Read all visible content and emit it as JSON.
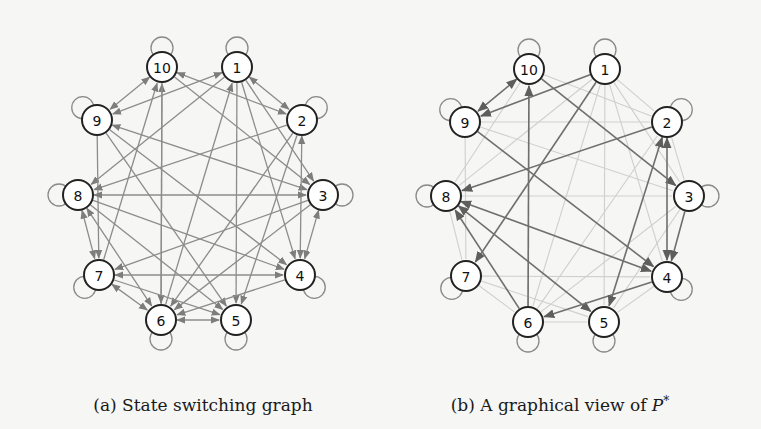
{
  "figure": {
    "panels": [
      {
        "id": "a",
        "caption": "(a) State switching graph",
        "caption_pos": [
          203,
          411
        ],
        "edge_color": "#8c8c8c",
        "nodes": [
          {
            "id": "1",
            "x": 237,
            "y": 67,
            "loop": "up"
          },
          {
            "id": "2",
            "x": 302,
            "y": 120,
            "loop": "upright"
          },
          {
            "id": "3",
            "x": 323,
            "y": 195,
            "loop": "right"
          },
          {
            "id": "4",
            "x": 300,
            "y": 275,
            "loop": "downright"
          },
          {
            "id": "5",
            "x": 236,
            "y": 320,
            "loop": "down"
          },
          {
            "id": "6",
            "x": 161,
            "y": 320,
            "loop": "down"
          },
          {
            "id": "7",
            "x": 99,
            "y": 275,
            "loop": "downleft"
          },
          {
            "id": "8",
            "x": 78,
            "y": 195,
            "loop": "left"
          },
          {
            "id": "9",
            "x": 97,
            "y": 120,
            "loop": "upleft"
          },
          {
            "id": "10",
            "x": 162,
            "y": 67,
            "loop": "up"
          }
        ],
        "edges": [
          {
            "from": "10",
            "to": "9",
            "both": true,
            "w": "dark"
          },
          {
            "from": "1",
            "to": "9",
            "both": true,
            "w": "dark"
          },
          {
            "from": "1",
            "to": "2",
            "both": true,
            "w": "dark"
          },
          {
            "from": "10",
            "to": "2",
            "both": true,
            "w": "dark"
          },
          {
            "from": "10",
            "to": "3",
            "both": false,
            "w": "dark"
          },
          {
            "from": "1",
            "to": "8",
            "both": false,
            "w": "dark"
          },
          {
            "from": "1",
            "to": "4",
            "both": false,
            "w": "dark"
          },
          {
            "from": "1",
            "to": "5",
            "both": false,
            "w": "dark"
          },
          {
            "from": "1",
            "to": "3",
            "both": false,
            "w": "dark"
          },
          {
            "from": "6",
            "to": "1",
            "both": false,
            "w": "dark"
          },
          {
            "from": "6",
            "to": "10",
            "both": false,
            "w": "dark"
          },
          {
            "from": "7",
            "to": "10",
            "both": false,
            "w": "dark"
          },
          {
            "from": "10",
            "to": "6",
            "both": false,
            "w": "dark"
          },
          {
            "from": "9",
            "to": "3",
            "both": true,
            "w": "dark"
          },
          {
            "from": "9",
            "to": "5",
            "both": false,
            "w": "dark"
          },
          {
            "from": "9",
            "to": "7",
            "both": false,
            "w": "dark"
          },
          {
            "from": "2",
            "to": "8",
            "both": false,
            "w": "dark"
          },
          {
            "from": "2",
            "to": "4",
            "both": true,
            "w": "dark"
          },
          {
            "from": "2",
            "to": "6",
            "both": false,
            "w": "dark"
          },
          {
            "from": "2",
            "to": "5",
            "both": false,
            "w": "dark"
          },
          {
            "from": "8",
            "to": "3",
            "both": true,
            "w": "dark"
          },
          {
            "from": "8",
            "to": "4",
            "both": false,
            "w": "dark"
          },
          {
            "from": "8",
            "to": "5",
            "both": false,
            "w": "dark"
          },
          {
            "from": "8",
            "to": "7",
            "both": true,
            "w": "dark"
          },
          {
            "from": "8",
            "to": "6",
            "both": true,
            "w": "dark"
          },
          {
            "from": "3",
            "to": "4",
            "both": true,
            "w": "dark"
          },
          {
            "from": "3",
            "to": "6",
            "both": false,
            "w": "dark"
          },
          {
            "from": "3",
            "to": "7",
            "both": false,
            "w": "dark"
          },
          {
            "from": "7",
            "to": "4",
            "both": true,
            "w": "dark"
          },
          {
            "from": "7",
            "to": "6",
            "both": true,
            "w": "dark"
          },
          {
            "from": "7",
            "to": "5",
            "both": false,
            "w": "dark"
          },
          {
            "from": "4",
            "to": "6",
            "both": false,
            "w": "dark"
          },
          {
            "from": "6",
            "to": "5",
            "both": true,
            "w": "dark"
          },
          {
            "from": "9",
            "to": "4",
            "both": false,
            "w": "dark"
          }
        ]
      },
      {
        "id": "b",
        "caption": "(b) A graphical view of P*",
        "caption_pos": [
          560,
          411
        ],
        "edge_color": "#6f6f6f",
        "light_edge_color": "#cfcfcf",
        "nodes": [
          {
            "id": "1",
            "x": 605,
            "y": 69,
            "loop": "up"
          },
          {
            "id": "2",
            "x": 667,
            "y": 122,
            "loop": "upright"
          },
          {
            "id": "3",
            "x": 689,
            "y": 196,
            "loop": "right"
          },
          {
            "id": "4",
            "x": 667,
            "y": 277,
            "loop": "downright"
          },
          {
            "id": "5",
            "x": 604,
            "y": 322,
            "loop": "down"
          },
          {
            "id": "6",
            "x": 528,
            "y": 322,
            "loop": "down"
          },
          {
            "id": "7",
            "x": 466,
            "y": 276,
            "loop": "downleft"
          },
          {
            "id": "8",
            "x": 446,
            "y": 196,
            "loop": "left"
          },
          {
            "id": "9",
            "x": 465,
            "y": 122,
            "loop": "upleft"
          },
          {
            "id": "10",
            "x": 529,
            "y": 69,
            "loop": "up"
          }
        ],
        "edges": [
          {
            "from": "10",
            "to": "9",
            "both": true,
            "w": "dark"
          },
          {
            "from": "1",
            "to": "9",
            "both": false,
            "w": "dark"
          },
          {
            "from": "10",
            "to": "3",
            "both": false,
            "w": "dark"
          },
          {
            "from": "9",
            "to": "4",
            "both": false,
            "w": "dark"
          },
          {
            "from": "2",
            "to": "8",
            "both": false,
            "w": "dark"
          },
          {
            "from": "6",
            "to": "10",
            "both": false,
            "w": "dark"
          },
          {
            "from": "8",
            "to": "4",
            "both": true,
            "w": "dark"
          },
          {
            "from": "8",
            "to": "5",
            "both": true,
            "w": "dark"
          },
          {
            "from": "6",
            "to": "8",
            "both": false,
            "w": "dark"
          },
          {
            "from": "4",
            "to": "6",
            "both": false,
            "w": "dark"
          },
          {
            "from": "2",
            "to": "4",
            "both": true,
            "w": "dark"
          },
          {
            "from": "3",
            "to": "4",
            "both": false,
            "w": "dark"
          },
          {
            "from": "2",
            "to": "5",
            "both": true,
            "w": "dark"
          },
          {
            "from": "1",
            "to": "7",
            "both": false,
            "w": "dark"
          },
          {
            "from": "1",
            "to": "2",
            "both": false,
            "w": "light"
          },
          {
            "from": "1",
            "to": "3",
            "both": false,
            "w": "light"
          },
          {
            "from": "1",
            "to": "4",
            "both": false,
            "w": "light"
          },
          {
            "from": "1",
            "to": "5",
            "both": false,
            "w": "light"
          },
          {
            "from": "1",
            "to": "6",
            "both": false,
            "w": "light"
          },
          {
            "from": "1",
            "to": "8",
            "both": false,
            "w": "light"
          },
          {
            "from": "10",
            "to": "2",
            "both": false,
            "w": "light"
          },
          {
            "from": "10",
            "to": "6",
            "both": false,
            "w": "light"
          },
          {
            "from": "10",
            "to": "8",
            "both": false,
            "w": "light"
          },
          {
            "from": "9",
            "to": "3",
            "both": false,
            "w": "light"
          },
          {
            "from": "9",
            "to": "7",
            "both": false,
            "w": "light"
          },
          {
            "from": "9",
            "to": "2",
            "both": false,
            "w": "light"
          },
          {
            "from": "8",
            "to": "3",
            "both": false,
            "w": "light"
          },
          {
            "from": "8",
            "to": "7",
            "both": false,
            "w": "light"
          },
          {
            "from": "7",
            "to": "4",
            "both": false,
            "w": "light"
          },
          {
            "from": "7",
            "to": "5",
            "both": false,
            "w": "light"
          },
          {
            "from": "7",
            "to": "6",
            "both": false,
            "w": "light"
          },
          {
            "from": "6",
            "to": "5",
            "both": false,
            "w": "light"
          },
          {
            "from": "6",
            "to": "3",
            "both": false,
            "w": "light"
          },
          {
            "from": "6",
            "to": "2",
            "both": false,
            "w": "light"
          },
          {
            "from": "3",
            "to": "5",
            "both": false,
            "w": "light"
          },
          {
            "from": "2",
            "to": "3",
            "both": false,
            "w": "light"
          },
          {
            "from": "4",
            "to": "5",
            "both": false,
            "w": "light"
          }
        ]
      }
    ]
  }
}
